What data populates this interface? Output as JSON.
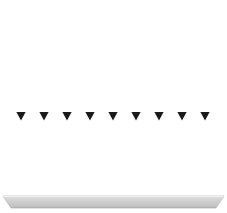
{
  "figure": {
    "width": 227,
    "height": 213,
    "background_color": "#ffffff"
  },
  "chart_data": {
    "type": "diagram",
    "title": "",
    "xlabel": "",
    "ylabel": "",
    "field_lines": {
      "count": 9,
      "direction": "down",
      "line_color": "#a8a8a8",
      "line_width": 1.4,
      "top_y": 9,
      "bottom_y": 197,
      "x_positions": [
        21,
        44,
        67,
        90,
        113,
        136,
        159,
        182,
        205
      ],
      "spacing": 23
    },
    "arrowheads": {
      "count": 9,
      "shape": "triangle-down",
      "color": "#1a1a1a",
      "center_y": 116,
      "tip_y": 120.5,
      "base_y": 112,
      "half_width": 4.6
    },
    "ground": {
      "shape": "trapezoid",
      "label": "ground-plane",
      "top_y": 196,
      "bottom_y": 208,
      "top_left_x": 3,
      "top_right_x": 224,
      "bottom_left_x": 11,
      "bottom_right_x": 216,
      "fill_top_color": "#d6d6d6",
      "fill_bottom_color": "#c2c2c2",
      "edge_color": "#b5b5b5",
      "top_highlight_color": "#efefef"
    }
  }
}
